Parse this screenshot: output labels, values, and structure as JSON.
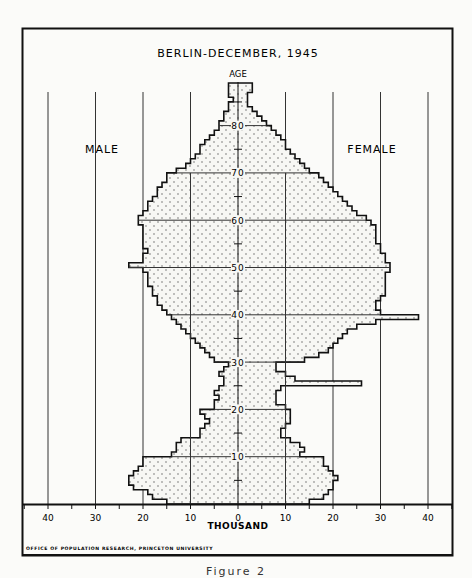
{
  "chart_data": {
    "type": "bar",
    "subtype": "population-pyramid",
    "title": "BERLIN-DECEMBER, 1945",
    "xlabel": "THOUSAND",
    "ylabel": "AGE",
    "left_label": "MALE",
    "right_label": "FEMALE",
    "x_ticks": [
      40,
      30,
      20,
      10,
      0,
      10,
      20,
      30,
      40
    ],
    "y_ticks": [
      10,
      20,
      30,
      40,
      50,
      60,
      70,
      80
    ],
    "xlim": [
      -45,
      45
    ],
    "ylim": [
      0,
      92
    ],
    "grid": true,
    "source": "OFFICE OF POPULATION RESEARCH, PRINCETON UNIVERSITY",
    "ages": [
      0,
      1,
      2,
      3,
      4,
      5,
      6,
      7,
      8,
      9,
      10,
      11,
      12,
      13,
      14,
      15,
      16,
      17,
      18,
      19,
      20,
      21,
      22,
      23,
      24,
      25,
      26,
      27,
      28,
      29,
      30,
      31,
      32,
      33,
      34,
      35,
      36,
      37,
      38,
      39,
      40,
      41,
      42,
      43,
      44,
      45,
      46,
      47,
      48,
      49,
      50,
      51,
      52,
      53,
      54,
      55,
      56,
      57,
      58,
      59,
      60,
      61,
      62,
      63,
      64,
      65,
      66,
      67,
      68,
      69,
      70,
      71,
      72,
      73,
      74,
      75,
      76,
      77,
      78,
      79,
      80,
      81,
      82,
      83,
      84,
      85,
      86,
      87,
      88
    ],
    "series": [
      {
        "name": "Male",
        "values": [
          15,
          18,
          19,
          22,
          23,
          23,
          22,
          21,
          20,
          20,
          14,
          13,
          13,
          12,
          8,
          8,
          7,
          6,
          7,
          8,
          5,
          5,
          4,
          5,
          4,
          3,
          3,
          4,
          3,
          2,
          5,
          6,
          7,
          8,
          9,
          10,
          11,
          12,
          13,
          14,
          15,
          16,
          17,
          17,
          18,
          18,
          19,
          19,
          19,
          20,
          23,
          20,
          20,
          19,
          20,
          20,
          20,
          20,
          20,
          21,
          21,
          20,
          19,
          19,
          18,
          17,
          17,
          16,
          15,
          15,
          13,
          11,
          10,
          9,
          8,
          8,
          7,
          6,
          5,
          4,
          4,
          3,
          3,
          2,
          2,
          1,
          2,
          2,
          2
        ]
      },
      {
        "name": "Female",
        "values": [
          15,
          18,
          19,
          20,
          20,
          21,
          20,
          19,
          18,
          18,
          13,
          14,
          13,
          11,
          9,
          9,
          10,
          11,
          11,
          11,
          10,
          8,
          8,
          8,
          9,
          26,
          12,
          10,
          8,
          8,
          14,
          17,
          19,
          20,
          21,
          22,
          23,
          25,
          29,
          38,
          30,
          29,
          29,
          30,
          31,
          31,
          31,
          31,
          31,
          32,
          32,
          31,
          31,
          30,
          30,
          29,
          29,
          29,
          29,
          28,
          27,
          25,
          24,
          23,
          22,
          21,
          20,
          19,
          18,
          17,
          15,
          14,
          13,
          12,
          11,
          10,
          10,
          9,
          8,
          7,
          6,
          5,
          4,
          3,
          2,
          2,
          2,
          3,
          3
        ]
      }
    ]
  },
  "caption": "Figure 2"
}
